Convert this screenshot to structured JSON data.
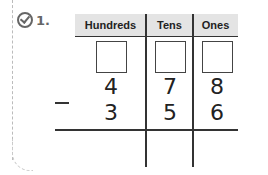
{
  "problem": {
    "number": "1.",
    "icon": "check-circle-icon"
  },
  "table": {
    "headers": [
      "Hundreds",
      "Tens",
      "Ones"
    ],
    "regroup_boxes": [
      "",
      "",
      ""
    ],
    "minuend": [
      "4",
      "7",
      "8"
    ],
    "operator": "−",
    "subtrahend": [
      "3",
      "5",
      "6"
    ],
    "answer": [
      "",
      "",
      ""
    ]
  },
  "colors": {
    "header_bg": "#e4e4e4",
    "lines": "#333333"
  }
}
